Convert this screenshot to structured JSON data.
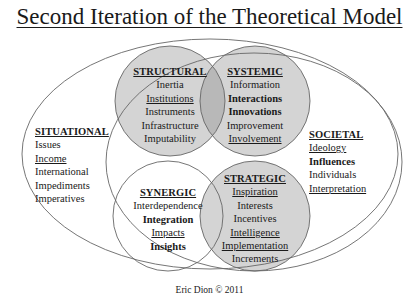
{
  "title": "Second Iteration of the Theoretical Model",
  "footer": "Eric Dion © 2011",
  "colors": {
    "circle_fill": "#d4d4d4",
    "overlap_fill": "#b8b8b8",
    "stroke": "#666666"
  },
  "groups": {
    "structural": {
      "heading": "STRUCTURAL",
      "items": [
        {
          "text": "Inertia",
          "style": "plain"
        },
        {
          "text": "Institutions",
          "style": "underline"
        },
        {
          "text": "Instruments",
          "style": "plain"
        },
        {
          "text": "Infrastructure",
          "style": "plain"
        },
        {
          "text": "Imputability",
          "style": "plain"
        }
      ]
    },
    "systemic": {
      "heading": "SYSTEMIC",
      "items": [
        {
          "text": "Information",
          "style": "plain"
        },
        {
          "text": "Interactions",
          "style": "bold"
        },
        {
          "text": "Innovations",
          "style": "bold"
        },
        {
          "text": "Improvement",
          "style": "plain"
        },
        {
          "text": "Involvement",
          "style": "underline"
        }
      ]
    },
    "situational": {
      "heading": "SITUATIONAL",
      "items": [
        {
          "text": "Issues",
          "style": "plain"
        },
        {
          "text": "Income",
          "style": "underline"
        },
        {
          "text": "International",
          "style": "plain"
        },
        {
          "text": "Impediments",
          "style": "plain"
        },
        {
          "text": "Imperatives",
          "style": "plain"
        }
      ]
    },
    "societal": {
      "heading": "SOCIETAL",
      "items": [
        {
          "text": "Ideology",
          "style": "underline"
        },
        {
          "text": "Influences",
          "style": "bold"
        },
        {
          "text": "Individuals",
          "style": "plain"
        },
        {
          "text": "Interpretation",
          "style": "underline"
        }
      ]
    },
    "synergic": {
      "heading": "SYNERGIC",
      "items": [
        {
          "text": "Interdependence",
          "style": "plain"
        },
        {
          "text": "Integration",
          "style": "bold"
        },
        {
          "text": "Impacts",
          "style": "underline"
        },
        {
          "text": "Insights",
          "style": "bold"
        }
      ]
    },
    "strategic": {
      "heading": "STRATEGIC",
      "items": [
        {
          "text": "Inspiration",
          "style": "underline"
        },
        {
          "text": "Interests",
          "style": "plain"
        },
        {
          "text": "Incentives",
          "style": "plain"
        },
        {
          "text": "Intelligence",
          "style": "underline"
        },
        {
          "text": "Implementation",
          "style": "underline"
        },
        {
          "text": "Increments",
          "style": "plain"
        }
      ]
    }
  }
}
